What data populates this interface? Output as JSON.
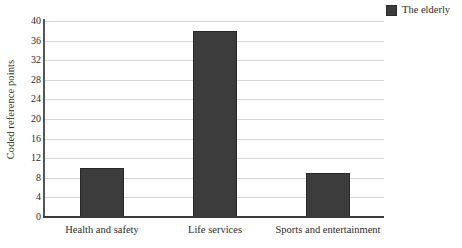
{
  "chart_data": {
    "type": "bar",
    "title": "",
    "xlabel": "",
    "ylabel": "Coded reference points",
    "categories": [
      "Health and safety",
      "Life services",
      "Sports and entertainment"
    ],
    "series": [
      {
        "name": "The elderly",
        "color": "#3c3c3c",
        "values": [
          10,
          38,
          9
        ]
      }
    ],
    "values": [
      10,
      38,
      9
    ],
    "ylim": [
      0,
      40
    ],
    "ytick_step": 4,
    "yticks": [
      "40",
      "36",
      "32",
      "28",
      "24",
      "20",
      "16",
      "12",
      "8",
      "4",
      "0"
    ],
    "grid": "horizontal",
    "legend_position": "top-right",
    "gridline_color": "#d8d8d8",
    "axis_color": "#3a3a3a"
  },
  "legend": {
    "entries": [
      {
        "label": "The elderly",
        "color": "#3c3c3c"
      }
    ]
  }
}
